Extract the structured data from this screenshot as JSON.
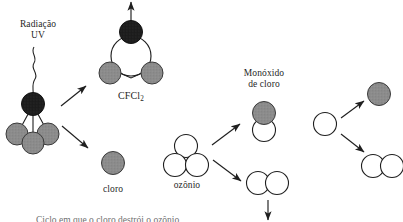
{
  "diagram": {
    "title_visible": false,
    "background": "#ffffff",
    "colors": {
      "dark_atom": "#1d1d1d",
      "gray_atom": "#8c8c8c",
      "white_atom": "#ffffff",
      "stroke": "#1f1f1f",
      "text": "#1f1f1f"
    },
    "labels": {
      "radiation_line1": "Radiação",
      "radiation_line2": "UV",
      "cfcl2": "CFCl",
      "cfcl2_sub": "2",
      "cloro": "cloro",
      "ozonio": "ozônio",
      "monoxido_line1": "Monóxido",
      "monoxido_line2": "de cloro",
      "cut_off_caption": "Ciclo em que o cloro destrói o ozônio"
    },
    "molecules": [
      {
        "name": "cfc-source-molecule",
        "description": "CFC molecule struck by UV radiation",
        "atoms": [
          {
            "kind": "dark",
            "label": "carbon"
          },
          {
            "kind": "gray",
            "label": "chlorine"
          },
          {
            "kind": "gray",
            "label": "chlorine"
          },
          {
            "kind": "gray",
            "label": "chlorine"
          }
        ]
      },
      {
        "name": "cfcl2-molecule",
        "description": "CFCl2 radical with escaping atom",
        "atoms": [
          {
            "kind": "dark",
            "label": "carbon"
          },
          {
            "kind": "white",
            "label": "core"
          },
          {
            "kind": "gray",
            "label": "chlorine"
          },
          {
            "kind": "gray",
            "label": "chlorine"
          }
        ]
      },
      {
        "name": "free-chlorine-atom",
        "description": "Free chlorine atom",
        "atoms": [
          {
            "kind": "gray",
            "label": "chlorine"
          }
        ]
      },
      {
        "name": "ozone-molecule",
        "description": "Ozone O3, three oxygen atoms",
        "atoms": [
          {
            "kind": "white",
            "label": "oxygen"
          },
          {
            "kind": "white",
            "label": "oxygen"
          },
          {
            "kind": "white",
            "label": "oxygen"
          }
        ]
      },
      {
        "name": "chlorine-monoxide-molecule",
        "description": "Chlorine monoxide ClO",
        "atoms": [
          {
            "kind": "gray",
            "label": "chlorine"
          },
          {
            "kind": "white",
            "label": "oxygen"
          }
        ]
      },
      {
        "name": "oxygen-molecule-lower",
        "description": "Oxygen molecule O2 produced from ozone",
        "atoms": [
          {
            "kind": "white",
            "label": "oxygen"
          },
          {
            "kind": "white",
            "label": "oxygen"
          }
        ]
      },
      {
        "name": "free-oxygen-atom",
        "description": "Single oxygen atom that splits ClO",
        "atoms": [
          {
            "kind": "white",
            "label": "oxygen"
          }
        ]
      },
      {
        "name": "released-chlorine-atom",
        "description": "Chlorine atom released again",
        "atoms": [
          {
            "kind": "gray",
            "label": "chlorine"
          }
        ]
      },
      {
        "name": "oxygen-molecule-right",
        "description": "Oxygen molecule O2 formed at right",
        "atoms": [
          {
            "kind": "white",
            "label": "oxygen"
          },
          {
            "kind": "white",
            "label": "oxygen"
          }
        ]
      }
    ],
    "arrows": [
      {
        "name": "arrow-cfc-to-cfcl2",
        "direction": "up-right"
      },
      {
        "name": "arrow-cfc-to-chlorine",
        "direction": "down-right"
      },
      {
        "name": "arrow-escape-up",
        "direction": "up"
      },
      {
        "name": "arrow-ozone-to-clo",
        "direction": "up-right"
      },
      {
        "name": "arrow-ozone-to-o2",
        "direction": "down-right"
      },
      {
        "name": "arrow-o2-down",
        "direction": "down"
      },
      {
        "name": "arrow-o-to-chlorine",
        "direction": "up-right"
      },
      {
        "name": "arrow-o-to-o2",
        "direction": "down-right"
      }
    ]
  }
}
